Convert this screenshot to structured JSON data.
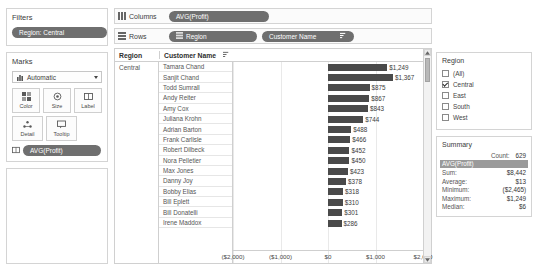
{
  "filters": {
    "title": "Filters",
    "pill_label": "Region: Central"
  },
  "marks": {
    "title": "Marks",
    "type_select": "Automatic",
    "buttons": [
      {
        "label": "Color",
        "icon": "color-icon"
      },
      {
        "label": "Size",
        "icon": "size-icon"
      },
      {
        "label": "Label",
        "icon": "label-icon"
      },
      {
        "label": "Detail",
        "icon": "detail-icon"
      },
      {
        "label": "Tooltip",
        "icon": "tooltip-icon"
      }
    ],
    "pill_label": "AVG(Profit)"
  },
  "shelves": {
    "columns_label": "Columns",
    "rows_label": "Rows",
    "columns_pills": [
      "AVG(Profit)"
    ],
    "rows_pills": [
      "Region",
      "Customer Name"
    ]
  },
  "table": {
    "header_region": "Region",
    "header_customer": "Customer Name",
    "region_value": "Central"
  },
  "legend": {
    "title": "Region",
    "items": [
      {
        "label": "(All)",
        "checked": false
      },
      {
        "label": "Central",
        "checked": true
      },
      {
        "label": "East",
        "checked": false
      },
      {
        "label": "South",
        "checked": false
      },
      {
        "label": "West",
        "checked": false
      }
    ]
  },
  "summary": {
    "title": "Summary",
    "count_label": "Count:",
    "count_value": "629",
    "field_band": "AVG(Profit)",
    "rows": [
      {
        "label": "Sum:",
        "value": "$8,442"
      },
      {
        "label": "Average:",
        "value": "$13"
      },
      {
        "label": "Minimum:",
        "value": "($2,465)"
      },
      {
        "label": "Maximum:",
        "value": "$1,249"
      },
      {
        "label": "Median:",
        "value": "$6"
      }
    ]
  },
  "chart_data": {
    "type": "bar",
    "title": "",
    "xlabel": "AVG(Profit)",
    "ylabel": "Customer Name",
    "orientation": "horizontal",
    "xlim": [
      -2000,
      2000
    ],
    "xticks": [
      -2000,
      -1000,
      0,
      1000,
      2000
    ],
    "xtick_labels": [
      "($2,000)",
      "($1,000)",
      "$0",
      "$1,000",
      "$2,000"
    ],
    "grid": true,
    "bar_color": "#4a4a4a",
    "categories": [
      "Tamara Chand",
      "Sanjit Chand",
      "Todd Sumrall",
      "Andy Reiter",
      "Amy Cox",
      "Juliana Krohn",
      "Adrian Barton",
      "Frank Carlisle",
      "Robert Dilbeck",
      "Nora Pelletier",
      "Max Jones",
      "Danny Joy",
      "Bobby Elias",
      "Bill Eplett",
      "Bill Donatelli",
      "Irene Maddox"
    ],
    "values": [
      1249,
      1367,
      875,
      867,
      843,
      744,
      488,
      466,
      452,
      450,
      423,
      378,
      318,
      310,
      301,
      286
    ],
    "data_labels": [
      "$1,249",
      "$1,367",
      "$875",
      "$867",
      "$843",
      "$744",
      "$488",
      "$466",
      "$452",
      "$450",
      "$423",
      "$378",
      "$318",
      "$310",
      "$301",
      "$286"
    ]
  }
}
